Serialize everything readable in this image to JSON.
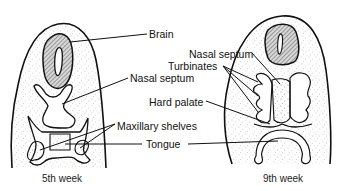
{
  "figure": {
    "panels": [
      {
        "id": "left",
        "caption": "5th week"
      },
      {
        "id": "right",
        "caption": "9th week"
      }
    ],
    "labels": {
      "brain": "Brain",
      "nasal_septum_right": "Nasal septum",
      "turbinates": "Turbinates",
      "nasal_septum_left": "Nasal septum",
      "hard_palate": "Hard palate",
      "maxillary_shelves": "Maxillary shelves",
      "tongue": "Tongue"
    },
    "colors": {
      "ink": "#111111",
      "stipple": "#9a9a9a",
      "background": "#ffffff"
    }
  }
}
